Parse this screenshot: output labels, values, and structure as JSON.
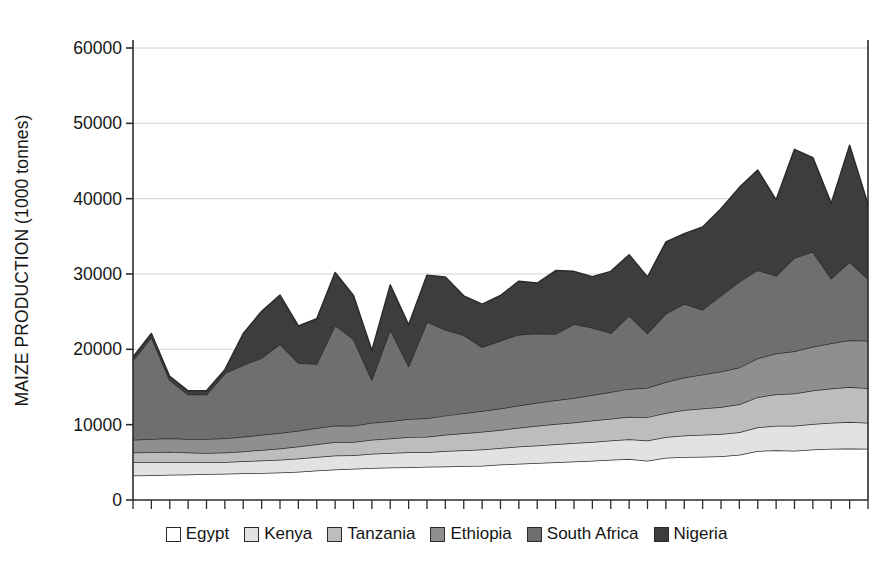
{
  "chart_data": {
    "type": "area",
    "stacked": true,
    "title": "",
    "xlabel": "",
    "ylabel": "MAIZE PRODUCTION (1000 tonnes)",
    "ylim": [
      0,
      60000
    ],
    "yticks": [
      0,
      10000,
      20000,
      30000,
      40000,
      50000,
      60000
    ],
    "ytick_labels": [
      "0",
      "10000",
      "20000",
      "30000",
      "40000",
      "50000",
      "60000"
    ],
    "grid": true,
    "xtick_count": 41,
    "xtick_labels": [],
    "legend_position": "bottom",
    "x": [
      1,
      2,
      3,
      4,
      5,
      6,
      7,
      8,
      9,
      10,
      11,
      12,
      13,
      14,
      15,
      16,
      17,
      18,
      19,
      20,
      21,
      22,
      23,
      24,
      25,
      26,
      27,
      28,
      29,
      30,
      31,
      32,
      33,
      34,
      35,
      36,
      37,
      38,
      39,
      40,
      41
    ],
    "series": [
      {
        "name": "Egypt",
        "color": "#ffffff",
        "values": [
          3250,
          3300,
          3350,
          3400,
          3450,
          3500,
          3550,
          3600,
          3650,
          3750,
          3900,
          4050,
          4150,
          4250,
          4300,
          4350,
          4400,
          4450,
          4500,
          4550,
          4700,
          4800,
          4900,
          5000,
          5100,
          5200,
          5350,
          5450,
          5200,
          5600,
          5700,
          5750,
          5800,
          6000,
          6500,
          6600,
          6550,
          6700,
          6800,
          6850,
          6800
        ]
      },
      {
        "name": "Kenya",
        "color": "#e2e2e2",
        "values": [
          1800,
          1750,
          1700,
          1650,
          1600,
          1550,
          1600,
          1650,
          1700,
          1750,
          1800,
          1850,
          1800,
          1900,
          1950,
          2000,
          1950,
          2050,
          2100,
          2150,
          2200,
          2300,
          2350,
          2400,
          2450,
          2500,
          2550,
          2600,
          2700,
          2750,
          2850,
          2900,
          2950,
          3000,
          3150,
          3250,
          3300,
          3400,
          3450,
          3500,
          3450
        ]
      },
      {
        "name": "Tanzania",
        "color": "#bdbdbd",
        "values": [
          1250,
          1300,
          1350,
          1250,
          1200,
          1250,
          1300,
          1400,
          1500,
          1600,
          1700,
          1800,
          1750,
          1850,
          1900,
          2000,
          2050,
          2150,
          2250,
          2350,
          2400,
          2500,
          2600,
          2700,
          2750,
          2850,
          2900,
          3000,
          3100,
          3200,
          3400,
          3500,
          3600,
          3700,
          4000,
          4200,
          4300,
          4450,
          4550,
          4650,
          4600
        ]
      },
      {
        "name": "Ethiopia",
        "color": "#8f8f8f",
        "values": [
          1700,
          1750,
          1800,
          1800,
          1850,
          1900,
          1950,
          2000,
          2050,
          2100,
          2150,
          2200,
          2150,
          2250,
          2300,
          2400,
          2450,
          2550,
          2650,
          2750,
          2850,
          2950,
          3050,
          3150,
          3250,
          3400,
          3550,
          3700,
          3900,
          4100,
          4300,
          4500,
          4700,
          4900,
          5150,
          5400,
          5600,
          5800,
          6000,
          6200,
          6300
        ]
      },
      {
        "name": "South Africa",
        "color": "#6f6f6f",
        "values": [
          10500,
          13500,
          7700,
          5900,
          5900,
          8600,
          9500,
          10200,
          11800,
          9000,
          8500,
          13300,
          11500,
          5700,
          12200,
          7000,
          12800,
          11400,
          10400,
          8500,
          9000,
          9400,
          9200,
          8800,
          9800,
          8900,
          7800,
          9700,
          7200,
          9100,
          9800,
          8600,
          10100,
          11400,
          11700,
          10300,
          12400,
          12600,
          8600,
          10400,
          8200
        ]
      },
      {
        "name": "Nigeria",
        "color": "#3d3d3d",
        "values": [
          500,
          500,
          500,
          500,
          500,
          500,
          4200,
          6200,
          6500,
          4900,
          6000,
          7000,
          5800,
          3900,
          5900,
          5500,
          6200,
          7000,
          5200,
          5700,
          6000,
          7100,
          6700,
          8400,
          7000,
          6800,
          8200,
          8100,
          7500,
          9500,
          9300,
          11000,
          11500,
          12500,
          13300,
          10100,
          14400,
          12500,
          10000,
          15500,
          9900
        ]
      }
    ]
  },
  "legend": {
    "items": [
      {
        "label": "Egypt",
        "color": "#ffffff"
      },
      {
        "label": "Kenya",
        "color": "#e2e2e2"
      },
      {
        "label": "Tanzania",
        "color": "#bdbdbd"
      },
      {
        "label": "Ethiopia",
        "color": "#8f8f8f"
      },
      {
        "label": "South Africa",
        "color": "#6f6f6f"
      },
      {
        "label": "Nigeria",
        "color": "#3d3d3d"
      }
    ]
  },
  "axes": {
    "y_axis_title": "MAIZE PRODUCTION (1000 tonnes)"
  },
  "style": {
    "axis_color": "#2b2b2b",
    "grid_color": "#d4d4d4",
    "outline_color": "#2b2b2b",
    "background": "#ffffff"
  }
}
